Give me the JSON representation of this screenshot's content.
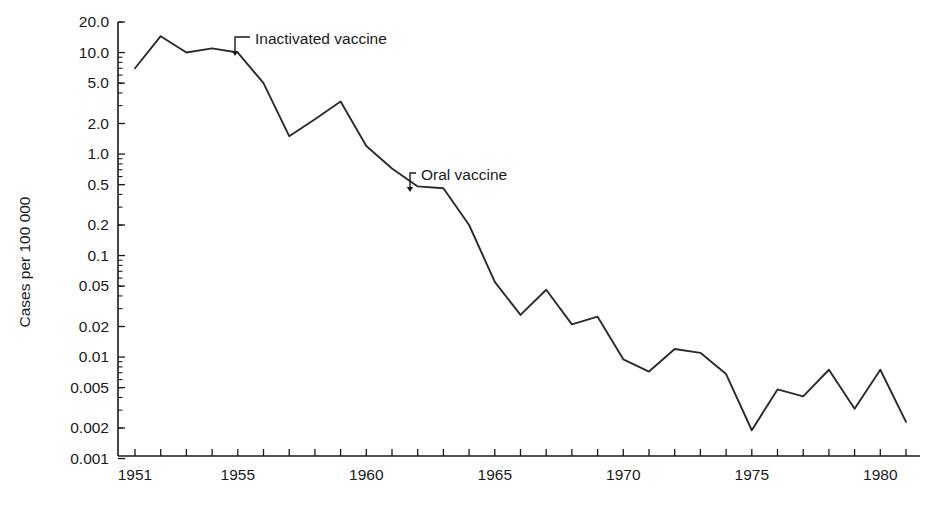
{
  "chart_data": {
    "type": "line",
    "title": "",
    "xlabel": "",
    "ylabel": "Cases per 100 000",
    "yscale": "log",
    "ylim": [
      0.001,
      20.0
    ],
    "xlim": [
      1951,
      1981
    ],
    "grid": false,
    "legend": null,
    "y_tick_labels": [
      "20.0",
      "10.0",
      "5.0",
      "2.0",
      "1.0",
      "0.5",
      "0.2",
      "0.1",
      "0.05",
      "0.02",
      "0.01",
      "0.005",
      "0.002",
      "0.001"
    ],
    "y_tick_values": [
      20.0,
      10.0,
      5.0,
      2.0,
      1.0,
      0.5,
      0.2,
      0.1,
      0.05,
      0.02,
      0.01,
      0.005,
      0.002,
      0.001
    ],
    "x_tick_labels": [
      "1951",
      "1955",
      "1960",
      "1965",
      "1970",
      "1975",
      "1980"
    ],
    "x_tick_values": [
      1951,
      1955,
      1960,
      1965,
      1970,
      1975,
      1980
    ],
    "x": [
      1951,
      1952,
      1953,
      1954,
      1955,
      1956,
      1957,
      1958,
      1959,
      1960,
      1961,
      1962,
      1963,
      1964,
      1965,
      1966,
      1967,
      1968,
      1969,
      1970,
      1971,
      1972,
      1973,
      1974,
      1975,
      1976,
      1977,
      1978,
      1979,
      1980,
      1981
    ],
    "values": [
      7.0,
      14.5,
      10.0,
      11.0,
      10.0,
      5.0,
      1.5,
      2.2,
      3.3,
      1.2,
      0.72,
      0.48,
      0.46,
      0.2,
      0.055,
      0.026,
      0.046,
      0.021,
      0.025,
      0.0095,
      0.0072,
      0.012,
      0.011,
      0.0068,
      0.0019,
      0.0048,
      0.0041,
      0.0075,
      0.0031,
      0.0075,
      0.0023
    ],
    "annotations": [
      {
        "label": "Inactivated vaccine",
        "x": 1955,
        "value": 10.0
      },
      {
        "label": "Oral vaccine",
        "x": 1962,
        "value": 0.48
      }
    ]
  },
  "geometry": {
    "plot_left": 118,
    "plot_right": 920,
    "plot_top": 22,
    "plot_bottom": 456,
    "x0_px": 135,
    "x_step_px": 25.7,
    "y_top_value": 20.0,
    "y_top_px": 22,
    "decade_px": 101.5
  },
  "annotation_leaders": [
    {
      "name": "inactivated-vaccine-leader",
      "text_x": 255,
      "text_y": 44,
      "elbow_x": 235,
      "elbow_y": 37,
      "tip_x": 235,
      "tip_y": 56
    },
    {
      "name": "oral-vaccine-leader",
      "text_x": 421,
      "text_y": 180,
      "elbow_x": 410,
      "elbow_y": 173,
      "tip_x": 410,
      "tip_y": 192
    }
  ]
}
